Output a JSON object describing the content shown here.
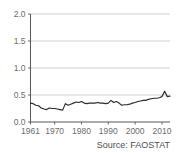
{
  "chart_data": {
    "type": "line",
    "title": "",
    "subtitle": "",
    "xlabel": "",
    "ylabel": "",
    "xlim": [
      1961,
      2013
    ],
    "ylim": [
      0.0,
      2.0
    ],
    "grid": true,
    "legend": "none",
    "annotations": [
      "Source: FAOSTAT"
    ],
    "ytick_labels": [
      "0.0",
      "0.5",
      "1.0",
      "1.5",
      "2.0"
    ],
    "ytick_values": [
      0.0,
      0.5,
      1.0,
      1.5,
      2.0
    ],
    "xtick_labels": [
      "1961",
      "1970",
      "1980",
      "1990",
      "2000",
      "2010"
    ],
    "xtick_values": [
      1961,
      1970,
      1980,
      1990,
      2000,
      2010
    ],
    "series": [
      {
        "name": "value",
        "color": "#2b2b2b",
        "x": [
          1961,
          1962,
          1963,
          1964,
          1965,
          1966,
          1967,
          1968,
          1969,
          1970,
          1971,
          1972,
          1973,
          1974,
          1975,
          1976,
          1977,
          1978,
          1979,
          1980,
          1981,
          1982,
          1983,
          1984,
          1985,
          1986,
          1987,
          1988,
          1989,
          1990,
          1991,
          1992,
          1993,
          1994,
          1995,
          1996,
          1997,
          1998,
          1999,
          2000,
          2001,
          2002,
          2003,
          2004,
          2005,
          2006,
          2007,
          2008,
          2009,
          2010,
          2011,
          2012,
          2013
        ],
        "values": [
          0.35,
          0.34,
          0.31,
          0.3,
          0.26,
          0.24,
          0.23,
          0.26,
          0.25,
          0.25,
          0.24,
          0.23,
          0.22,
          0.34,
          0.31,
          0.33,
          0.35,
          0.37,
          0.36,
          0.38,
          0.35,
          0.34,
          0.35,
          0.35,
          0.35,
          0.36,
          0.35,
          0.35,
          0.34,
          0.35,
          0.4,
          0.36,
          0.38,
          0.35,
          0.31,
          0.32,
          0.32,
          0.33,
          0.35,
          0.36,
          0.38,
          0.39,
          0.4,
          0.4,
          0.42,
          0.43,
          0.44,
          0.44,
          0.45,
          0.47,
          0.57,
          0.47,
          0.48
        ]
      }
    ]
  },
  "footer": {
    "source_text": "Source: FAOSTAT"
  }
}
